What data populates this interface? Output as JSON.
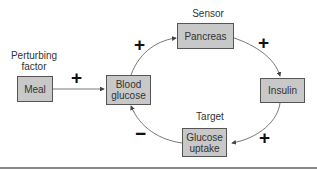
{
  "diagram": {
    "labels": {
      "perturbing": "Perturbing factor",
      "sensor": "Sensor",
      "target": "Target"
    },
    "nodes": {
      "meal": "Meal",
      "blood_glucose": "Blood glucose",
      "pancreas": "Pancreas",
      "insulin": "Insulin",
      "glucose_uptake": "Glucose uptake"
    },
    "signs": {
      "meal_to_glucose": "+",
      "glucose_to_pancreas": "+",
      "pancreas_to_insulin": "+",
      "insulin_to_uptake": "+",
      "uptake_to_glucose": "−"
    },
    "colors": {
      "box_fill": "#c8c8c8",
      "box_border": "#555555",
      "line": "#444444"
    }
  }
}
